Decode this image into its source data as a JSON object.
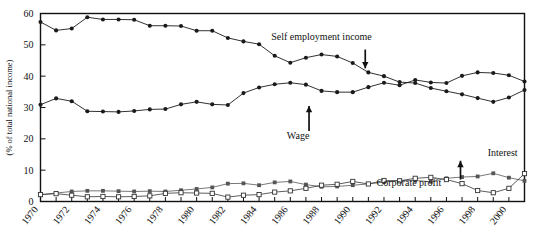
{
  "chart_data": {
    "type": "line",
    "title": "",
    "xlabel": "",
    "ylabel": "(% of total national income)",
    "xlim": [
      1970,
      2001
    ],
    "ylim": [
      0,
      60
    ],
    "yticks": [
      0,
      10,
      20,
      30,
      40,
      50,
      60
    ],
    "xticks": [
      1970,
      1971,
      1972,
      1973,
      1974,
      1975,
      1976,
      1977,
      1978,
      1979,
      1980,
      1981,
      1982,
      1983,
      1984,
      1985,
      1986,
      1987,
      1988,
      1989,
      1990,
      1991,
      1992,
      1993,
      1994,
      1995,
      1996,
      1997,
      1998,
      1999,
      2000,
      2001
    ],
    "xtick_labels": [
      "1970",
      "1972",
      "1974",
      "1976",
      "1978",
      "1980",
      "1982",
      "1984",
      "1986",
      "1988",
      "1990",
      "1992",
      "1994",
      "1996",
      "1998",
      "2000"
    ],
    "xtick_labeled_years": [
      1970,
      1972,
      1974,
      1976,
      1978,
      1980,
      1982,
      1984,
      1986,
      1988,
      1990,
      1992,
      1994,
      1996,
      1998,
      2000
    ],
    "grid": false,
    "legend_position": "inline-annotations",
    "x": [
      1970,
      1971,
      1972,
      1973,
      1974,
      1975,
      1976,
      1977,
      1978,
      1979,
      1980,
      1981,
      1982,
      1983,
      1984,
      1985,
      1986,
      1987,
      1988,
      1989,
      1990,
      1991,
      1992,
      1993,
      1994,
      1995,
      1996,
      1997,
      1998,
      1999,
      2000,
      2001
    ],
    "series": [
      {
        "name": "Self employment income",
        "marker": "filled-circle",
        "color": "#1a1a1a",
        "values": [
          57.3,
          54.6,
          55.2,
          58.8,
          58.1,
          58.1,
          58.0,
          56.1,
          56.1,
          56.0,
          54.5,
          54.5,
          52.2,
          51.1,
          50.2,
          46.5,
          44.3,
          45.9,
          46.9,
          46.3,
          44.2,
          41.2,
          40.0,
          38.1,
          37.8,
          36.2,
          35.2,
          34.2,
          33.0,
          31.8,
          33.2,
          35.6
        ]
      },
      {
        "name": "Wage",
        "marker": "filled-circle",
        "color": "#1a1a1a",
        "values": [
          30.9,
          32.9,
          32.0,
          28.8,
          28.7,
          28.6,
          28.9,
          29.4,
          29.5,
          31.0,
          31.8,
          31.0,
          30.8,
          34.6,
          36.4,
          37.4,
          37.9,
          37.3,
          35.3,
          34.9,
          34.9,
          36.5,
          37.9,
          37.1,
          38.8,
          38.0,
          37.8,
          40.1,
          41.2,
          41.0,
          40.3,
          38.3
        ]
      },
      {
        "name": "Interest",
        "marker": "filled-square",
        "color": "#555555",
        "values": [
          2.2,
          2.7,
          3.2,
          3.4,
          3.4,
          3.3,
          3.2,
          3.3,
          3.2,
          3.6,
          4.0,
          4.5,
          5.7,
          5.8,
          5.2,
          6.1,
          6.4,
          5.4,
          4.7,
          4.8,
          5.2,
          5.6,
          6.2,
          6.7,
          6.7,
          6.3,
          7.4,
          7.8,
          8.0,
          9.0,
          7.6,
          6.6
        ]
      },
      {
        "name": "Corporate profit",
        "marker": "open-square",
        "color": "#333333",
        "values": [
          2.2,
          2.5,
          2.0,
          1.5,
          1.6,
          1.5,
          1.6,
          1.8,
          2.6,
          2.8,
          2.7,
          2.6,
          1.4,
          2.0,
          2.2,
          3.0,
          3.4,
          4.2,
          5.2,
          5.5,
          6.4,
          5.6,
          6.7,
          6.6,
          7.4,
          7.7,
          7.0,
          5.7,
          3.5,
          2.8,
          4.2,
          8.9
        ]
      }
    ],
    "annotations": [
      {
        "text": "Self employment income",
        "x": 1988.0,
        "y": 51.5,
        "arrow": "down",
        "arrow_x": 1990.8,
        "arrow_y_from": 48.5,
        "arrow_y_to": 42.5
      },
      {
        "text": "Wage",
        "x": 1986.5,
        "y": 20.0,
        "arrow": "up",
        "arrow_x": 1987.2,
        "arrow_y_from": 22.5,
        "arrow_y_to": 30.5
      },
      {
        "text": "Corporate profit",
        "x": 1993.6,
        "y": 5.0,
        "arrow": "none"
      },
      {
        "text": "Interest",
        "x": 1999.6,
        "y": 14.4,
        "arrow": "up",
        "arrow_x": 1996.9,
        "arrow_y_from": 7.0,
        "arrow_y_to": 13.0
      }
    ]
  }
}
